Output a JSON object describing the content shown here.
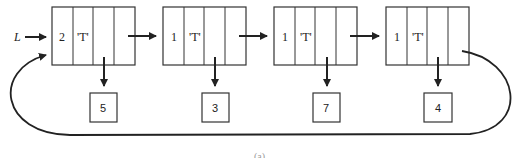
{
  "diagram": {
    "type": "circular linked list",
    "head_label": "L",
    "nodes": [
      {
        "count": "2",
        "tag": "'T'",
        "value": "5"
      },
      {
        "count": "1",
        "tag": "'T'",
        "value": "3"
      },
      {
        "count": "1",
        "tag": "'T'",
        "value": "7"
      },
      {
        "count": "1",
        "tag": "'T'",
        "value": "4"
      }
    ],
    "caption": "(a)"
  }
}
